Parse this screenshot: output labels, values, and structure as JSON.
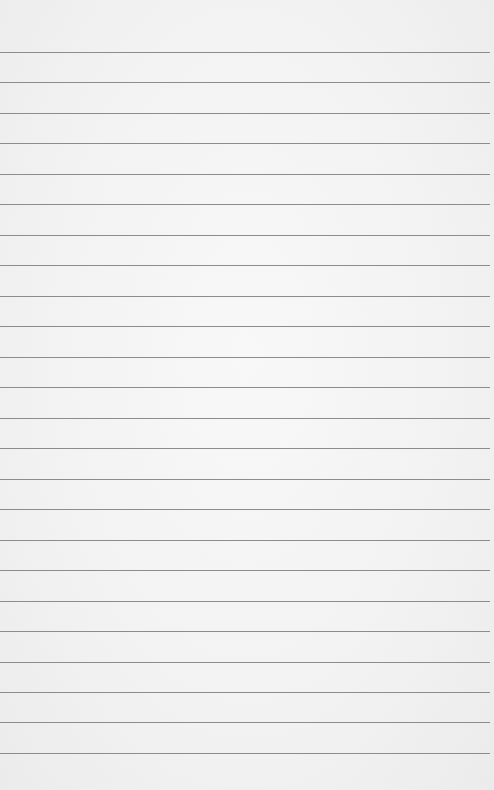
{
  "page": {
    "type": "lined-paper",
    "background_color": "#f1f1f1",
    "line_color": "#8c8c8c",
    "line_count": 24,
    "lines_y": [
      52,
      82,
      113,
      143,
      174,
      204,
      235,
      265,
      296,
      326,
      357,
      387,
      418,
      448,
      479,
      509,
      540,
      570,
      601,
      631,
      662,
      692,
      722,
      753
    ]
  }
}
